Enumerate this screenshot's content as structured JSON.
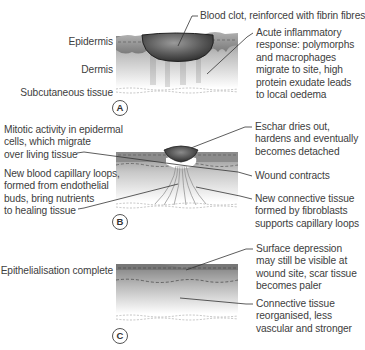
{
  "figure": {
    "panels": [
      {
        "id": "A",
        "layer_labels": [
          "Epidermis",
          "Dermis",
          "Subcutaneous tissue"
        ],
        "annotations": [
          "Blood clot, reinforced with fibrin fibres",
          [
            "Acute inflammatory",
            "response: polymorphs",
            "and macrophages",
            "migrate to site, high",
            "protein exudate leads",
            "to local oedema"
          ]
        ]
      },
      {
        "id": "B",
        "left_annotations": [
          [
            "Mitotic activity in epidermal",
            "cells, which migrate",
            "over living tissue"
          ],
          [
            "New blood capillary loops,",
            "formed from endothelial",
            "buds, bring nutrients",
            "to healing tissue"
          ]
        ],
        "right_annotations": [
          [
            "Eschar dries out,",
            "hardens and eventually",
            "becomes detached"
          ],
          [
            "Wound contracts"
          ],
          [
            "New connective tissue",
            "formed by fibroblasts",
            "supports capillary loops"
          ]
        ]
      },
      {
        "id": "C",
        "left_annotations": [
          "Epithelialisation complete"
        ],
        "right_annotations": [
          [
            "Surface depression",
            "may still be visible at",
            "wound site, scar tissue",
            "becomes paler"
          ],
          [
            "Connective tissue",
            "reorganised, less",
            "vascular and stronger"
          ]
        ]
      }
    ]
  },
  "labels": {
    "a_epidermis": "Epidermis",
    "a_dermis": "Dermis",
    "a_subcut": "Subcutaneous tissue",
    "a_clot": "Blood clot, reinforced with fibrin fibres",
    "a_inflam_1": "Acute inflammatory",
    "a_inflam_2": "response: polymorphs",
    "a_inflam_3": "and macrophages",
    "a_inflam_4": "migrate to site, high",
    "a_inflam_5": "protein exudate leads",
    "a_inflam_6": "to local oedema",
    "a_marker": "A",
    "b_mitotic_1": "Mitotic activity in epidermal",
    "b_mitotic_2": "cells, which migrate",
    "b_mitotic_3": "over living tissue",
    "b_cap_1": "New blood capillary loops,",
    "b_cap_2": "formed from endothelial",
    "b_cap_3": "buds, bring nutrients",
    "b_cap_4": "to healing tissue",
    "b_eschar_1": "Eschar dries out,",
    "b_eschar_2": "hardens and eventually",
    "b_eschar_3": "becomes detached",
    "b_contract": "Wound contracts",
    "b_conn_1": "New connective tissue",
    "b_conn_2": "formed by fibroblasts",
    "b_conn_3": "supports capillary loops",
    "b_marker": "B",
    "c_epi": "Epithelialisation complete",
    "c_surf_1": "Surface depression",
    "c_surf_2": "may still be visible at",
    "c_surf_3": "wound site, scar tissue",
    "c_surf_4": "becomes paler",
    "c_conn_1": "Connective tissue",
    "c_conn_2": "reorganised, less",
    "c_conn_3": "vascular and stronger",
    "c_marker": "C"
  },
  "colors": {
    "text": "#404040",
    "leader_line": "#333333",
    "tissue_dark": "#6e6e6e",
    "tissue_light": "#e8e8e8",
    "clot": "#4a4a4a"
  }
}
